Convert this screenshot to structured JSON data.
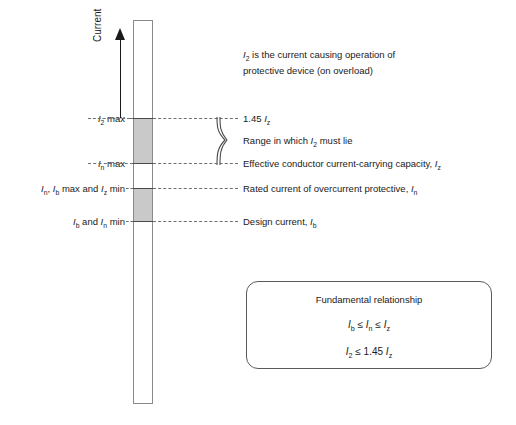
{
  "figure": {
    "axis_caption": "Current",
    "description": "I2 is the current causing operation of protective device (on overload)",
    "description_line1": "I2 is the current causing operation of",
    "description_line2": "protective device (on overload)"
  },
  "levels": [
    {
      "id": "i2-max",
      "left_label": "I2 max",
      "right_label": "1.45 Iz",
      "y": 118
    },
    {
      "id": "in-max",
      "left_label": "In max",
      "right_label": "Effective conductor current-carrying capacity, Iz",
      "y": 163
    },
    {
      "id": "in-ib-max-iz-min",
      "left_label": "In, Ib max and Iz min",
      "right_label": "Rated current of overcurrent protective, In",
      "y": 188
    },
    {
      "id": "ib-and-in-min",
      "left_label": "Ib and In min",
      "right_label": "Design current, Ib",
      "y": 221
    }
  ],
  "brace": {
    "label": "Range in which I2 must lie"
  },
  "fundamental_box": {
    "title": "Fundamental relationship",
    "equation_1": "Ib ≤ In ≤ Iz",
    "equation_2": "I2 ≤ 1.45 Iz"
  },
  "colors": {
    "band_fill": "#c9c9c9",
    "column_stroke": "#8a8a8a",
    "leader": "#6f6f6f",
    "text": "#1a1a1a",
    "box_stroke": "#5a5a5a"
  }
}
